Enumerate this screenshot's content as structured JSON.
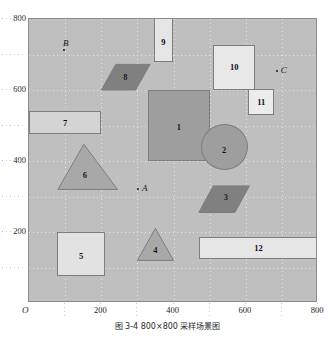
{
  "figure": {
    "caption": "图 3-4  800×800 采样场景图",
    "origin_label": "O",
    "plot_background_color": "#bfbfbf",
    "border_color": "#8c8c8c"
  },
  "chart_data": {
    "type": "scatter",
    "title": "图 3-4  800×800 采样场景图",
    "xlabel": "",
    "ylabel": "",
    "xlim": [
      0,
      800
    ],
    "ylim": [
      0,
      800
    ],
    "xticks": [
      200,
      400,
      600,
      800
    ],
    "yticks": [
      200,
      400,
      600,
      800
    ],
    "xtick_labels": [
      "200",
      "400",
      "600",
      "800"
    ],
    "ytick_labels": [
      "200",
      "400",
      "600",
      "800"
    ],
    "grid": true,
    "grid_step": 100,
    "legend": "none",
    "obstacles": [
      {
        "id": "1",
        "label": "1",
        "kind": "rect",
        "x": 330,
        "y": 400,
        "width": 170,
        "height": 200,
        "fill": "#9e9e9e",
        "label_x": 415,
        "label_y": 495
      },
      {
        "id": "2",
        "label": "2",
        "kind": "circle",
        "cx": 540,
        "cy": 440,
        "r": 65,
        "fill": "#9e9e9e",
        "label_x": 540,
        "label_y": 432
      },
      {
        "id": "3",
        "label": "3",
        "kind": "parallelogram",
        "points": "470,255 510,330 610,330 570,255",
        "fill": "#808080",
        "label_x": 545,
        "label_y": 298
      },
      {
        "id": "4",
        "label": "4",
        "kind": "triangle",
        "points": "350,210 300,120 400,120",
        "fill": "#a8a8a8",
        "label_x": 350,
        "label_y": 148
      },
      {
        "id": "5",
        "label": "5",
        "kind": "rect",
        "x": 78,
        "y": 75,
        "width": 132,
        "height": 125,
        "fill": "#e2e2e2",
        "label_x": 144,
        "label_y": 133
      },
      {
        "id": "6",
        "label": "6",
        "kind": "triangle",
        "points": "152,447 80,320 245,320",
        "fill": "#a8a8a8",
        "label_x": 155,
        "label_y": 360
      },
      {
        "id": "7",
        "label": "7",
        "kind": "rect",
        "x": 0,
        "y": 475,
        "width": 200,
        "height": 65,
        "fill": "#d4d4d4",
        "label_x": 100,
        "label_y": 508
      },
      {
        "id": "8",
        "label": "8",
        "kind": "parallelogram",
        "points": "200,600 240,672 335,672 295,600",
        "fill": "#808080",
        "label_x": 267,
        "label_y": 638
      },
      {
        "id": "9",
        "label": "9",
        "kind": "rect",
        "x": 345,
        "y": 680,
        "width": 55,
        "height": 140,
        "fill": "#e6e6e6",
        "label_x": 372,
        "label_y": 736
      },
      {
        "id": "10",
        "label": "10",
        "kind": "rect",
        "x": 510,
        "y": 600,
        "width": 115,
        "height": 128,
        "fill": "#e8e8e8",
        "label_x": 568,
        "label_y": 665
      },
      {
        "id": "11",
        "label": "11",
        "kind": "rect",
        "x": 607,
        "y": 530,
        "width": 72,
        "height": 72,
        "fill": "#ececec",
        "label_x": 643,
        "label_y": 565
      },
      {
        "id": "12",
        "label": "12",
        "kind": "rect",
        "x": 470,
        "y": 125,
        "width": 330,
        "height": 62,
        "fill": "#e6e6e6",
        "label_x": 635,
        "label_y": 155
      }
    ],
    "points": [
      {
        "name": "A",
        "x": 302,
        "y": 322
      },
      {
        "name": "B",
        "x": 97,
        "y": 712
      },
      {
        "name": "C",
        "x": 686,
        "y": 653
      }
    ]
  }
}
